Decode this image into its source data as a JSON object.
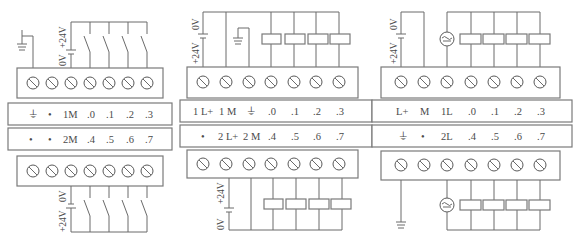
{
  "diagram": {
    "type": "PLC terminal wiring diagrams",
    "panels": [
      {
        "id": "left",
        "title": "DC input wiring (sink/source switches)",
        "top_supply_labels": [
          "0V",
          "+24V"
        ],
        "bottom_supply_labels": [
          "0V",
          "+24V"
        ],
        "label_rows": [
          [
            "⏚",
            "•",
            "1M",
            ".0",
            ".1",
            ".2",
            ".3"
          ],
          [
            "•",
            "•",
            "2M",
            ".4",
            ".5",
            ".6",
            ".7"
          ]
        ],
        "terminal_count": 7,
        "devices_top": [
          "switch",
          "switch",
          "switch",
          "switch"
        ],
        "devices_bottom": [
          "switch",
          "switch",
          "switch",
          "switch"
        ]
      },
      {
        "id": "middle",
        "title": "DC output wiring (loads)",
        "top_supply_labels": [
          "0V",
          "+24V"
        ],
        "bottom_supply_labels": [
          "+24V",
          "0V"
        ],
        "label_rows": [
          [
            "1 L+",
            "1 M",
            "⏚",
            ".0",
            ".1",
            ".2",
            ".3"
          ],
          [
            "•",
            "2 L+",
            "2 M",
            ".4",
            ".5",
            ".6",
            ".7"
          ]
        ],
        "terminal_count": 7,
        "devices_top": [
          "load",
          "load",
          "load",
          "load"
        ],
        "devices_bottom": [
          "load",
          "load",
          "load",
          "load"
        ]
      },
      {
        "id": "right",
        "title": "Relay output wiring (AC/DC loads)",
        "top_supply_labels": [
          "0V",
          "+24V"
        ],
        "label_rows": [
          [
            "L+",
            "M",
            "1L",
            ".0",
            ".1",
            ".2",
            ".3"
          ],
          [
            "⏚",
            "•",
            "2L",
            ".4",
            ".5",
            ".6",
            ".7"
          ]
        ],
        "terminal_count": 7,
        "devices_top": [
          "ac-source",
          "load",
          "load",
          "load",
          "load"
        ],
        "devices_bottom": [
          "ac-source",
          "load",
          "load",
          "load",
          "load"
        ]
      }
    ]
  },
  "texts": {
    "v0": "0V",
    "v24": "+24V"
  }
}
